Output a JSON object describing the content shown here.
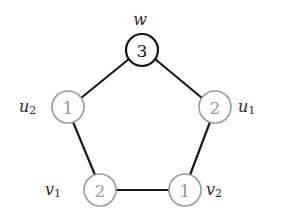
{
  "figure": {
    "type": "graph-diagram",
    "shape": "pentagon-cycle",
    "background_color": "#ffffff",
    "edge_color": "#1a1a1a",
    "highlight_node_color": "#141414",
    "normal_node_color": "#9a9a9a",
    "normal_value_color": "#9a9a9a",
    "highlight_value_color": "#141414",
    "label_color": "#2b2b2b"
  },
  "nodes": [
    {
      "id": "w",
      "label_base": "w",
      "label_sub": "",
      "value": "3",
      "cx": 142,
      "cy": 50,
      "r": 16,
      "style": "dark",
      "label_x": 140,
      "label_y": 19,
      "label_anchor": "middle"
    },
    {
      "id": "u2",
      "label_base": "u",
      "label_sub": "2",
      "value": "1",
      "cx": 68,
      "cy": 107,
      "r": 16,
      "style": "light",
      "label_x": 19,
      "label_y": 106,
      "label_anchor": "start"
    },
    {
      "id": "u1",
      "label_base": "u",
      "label_sub": "1",
      "value": "2",
      "cx": 215,
      "cy": 107,
      "r": 16,
      "style": "light",
      "label_x": 238,
      "label_y": 106,
      "label_anchor": "start"
    },
    {
      "id": "v1",
      "label_base": "v",
      "label_sub": "1",
      "value": "2",
      "cx": 100,
      "cy": 190,
      "r": 16,
      "style": "light",
      "label_x": 45,
      "label_y": 189,
      "label_anchor": "start"
    },
    {
      "id": "v2",
      "label_base": "v",
      "label_sub": "2",
      "value": "1",
      "cx": 185,
      "cy": 190,
      "r": 16,
      "style": "light",
      "label_x": 206,
      "label_y": 189,
      "label_anchor": "start"
    }
  ],
  "edges": [
    {
      "from": "w",
      "to": "u2",
      "x1": 129,
      "y1": 59,
      "x2": 81,
      "y2": 98
    },
    {
      "from": "w",
      "to": "u1",
      "x1": 155,
      "y1": 59,
      "x2": 202,
      "y2": 98
    },
    {
      "from": "u2",
      "to": "v1",
      "x1": 73,
      "y1": 122,
      "x2": 95,
      "y2": 175
    },
    {
      "from": "u1",
      "to": "v2",
      "x1": 210,
      "y1": 122,
      "x2": 190,
      "y2": 175
    },
    {
      "from": "v1",
      "to": "v2",
      "x1": 116,
      "y1": 190,
      "x2": 169,
      "y2": 190
    }
  ]
}
